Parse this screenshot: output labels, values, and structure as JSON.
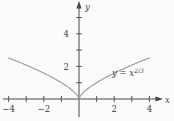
{
  "figure": {
    "background": "#fbfbfb",
    "axis_color": "#474747",
    "curve_color": "#999999",
    "text_color": "#3c3c3c",
    "curve_label_prefix": "y = x",
    "curve_label_exponent": "2/3"
  },
  "chart_data": {
    "type": "line",
    "title": "",
    "xlabel": "x",
    "ylabel": "y",
    "function": "y = x^(2/3)",
    "x_range": [
      -4,
      4
    ],
    "xlim": [
      -4.3,
      5.4
    ],
    "ylim": [
      -1.3,
      6.1
    ],
    "grid": false,
    "legend_position": "none",
    "x_ticks": [
      -4,
      -3,
      -2,
      -1,
      1,
      2,
      3,
      4
    ],
    "x_tick_labels": [
      "-4",
      "",
      "-2",
      "",
      "",
      "2",
      "",
      "4"
    ],
    "y_ticks": [
      1,
      2,
      3,
      4,
      5
    ],
    "y_tick_labels": [
      "",
      "2",
      "",
      "4",
      ""
    ],
    "series": [
      {
        "name": "y = x^(2/3)",
        "x": [
          -4,
          -3,
          -2,
          -1,
          0,
          1,
          2,
          3,
          4
        ],
        "values": [
          2.52,
          2.08,
          1.587,
          1.0,
          0.0,
          1.0,
          1.587,
          2.08,
          2.52
        ]
      }
    ],
    "annotations": [
      {
        "text": "y = x^(2/3)",
        "x": 1.93,
        "y": 1.43
      }
    ]
  }
}
